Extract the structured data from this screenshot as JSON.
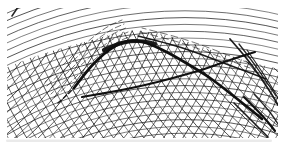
{
  "figure": {
    "canvas": {
      "width": 284,
      "height": 150
    },
    "colors": {
      "background": "#ffffff",
      "ink": "#101010",
      "smear": "#b9b9b9"
    },
    "content_clip": {
      "x": 7,
      "y": 8,
      "width": 271,
      "height": 130
    },
    "mesh_clip_boundary": [
      [
        0,
        70
      ],
      [
        30,
        58
      ],
      [
        62,
        48
      ],
      [
        92,
        40
      ],
      [
        116,
        33
      ],
      [
        136,
        30
      ],
      [
        162,
        34
      ],
      [
        186,
        41
      ],
      [
        208,
        49
      ],
      [
        236,
        58
      ],
      [
        266,
        66
      ],
      [
        284,
        70
      ],
      [
        284,
        150
      ],
      [
        0,
        150
      ]
    ],
    "arc_families": [
      {
        "name": "upper-concentric-arcs",
        "cx": 185,
        "cy": 432,
        "r_min": 292,
        "r_max": 466,
        "step": 6.8,
        "width": 0.75,
        "clipped": false
      },
      {
        "name": "steep-rising-arcs",
        "cx": -210,
        "cy": -120,
        "r_min": 246,
        "r_max": 566,
        "step": 8,
        "width": 0.8,
        "clipped": true
      },
      {
        "name": "steep-falling-arcs",
        "cx": 500,
        "cy": -150,
        "r_min": 266,
        "r_max": 586,
        "step": 8,
        "width": 0.8,
        "clipped": true
      }
    ],
    "feather_bands": [
      {
        "name": "arch-left-feather",
        "base": [
          [
            56,
            102
          ],
          [
            72,
            87
          ],
          [
            88,
            71
          ],
          [
            104,
            57
          ],
          [
            119,
            46
          ],
          [
            133,
            40
          ]
        ],
        "offsets": [
          [
            -2,
            -4
          ],
          [
            -5,
            -8
          ],
          [
            -7,
            -12
          ],
          [
            -9,
            -16
          ],
          [
            -11,
            -20
          ]
        ],
        "dash": "6 3",
        "width": 0.7,
        "opacity": 0.85
      },
      {
        "name": "arch-right-feather",
        "base": [
          [
            138,
            36
          ],
          [
            158,
            41
          ],
          [
            180,
            47
          ],
          [
            203,
            55
          ],
          [
            226,
            64
          ],
          [
            248,
            72
          ]
        ],
        "offsets": [
          [
            2,
            -4
          ],
          [
            4,
            -8
          ]
        ],
        "dash": "7 4",
        "width": 0.7,
        "opacity": 0.85
      }
    ],
    "envelope_curves": [
      {
        "name": "mesh-boundary-band",
        "width": 1.6,
        "opacity": 0.95,
        "dash": "",
        "points": [
          [
            138,
            36
          ],
          [
            158,
            41
          ],
          [
            180,
            47
          ],
          [
            203,
            55
          ],
          [
            226,
            64
          ],
          [
            248,
            72
          ],
          [
            266,
            79
          ]
        ]
      },
      {
        "name": "main-arch",
        "width": 2.7,
        "opacity": 1,
        "dash": "",
        "points": [
          [
            74,
            88
          ],
          [
            86,
            72
          ],
          [
            98,
            59
          ],
          [
            110,
            49
          ],
          [
            122,
            42
          ],
          [
            134,
            40
          ],
          [
            147,
            43
          ],
          [
            161,
            49
          ],
          [
            176,
            57
          ],
          [
            191,
            66
          ],
          [
            206,
            75
          ],
          [
            221,
            86
          ],
          [
            236,
            98
          ],
          [
            250,
            109
          ],
          [
            262,
            119
          ]
        ]
      },
      {
        "name": "arch-tail",
        "width": 1.5,
        "opacity": 0.9,
        "dash": "4 3",
        "points": [
          [
            58,
            103
          ],
          [
            66,
            96
          ],
          [
            74,
            88
          ]
        ]
      },
      {
        "name": "peak-thick-blob",
        "width": 4.2,
        "opacity": 0.95,
        "dash": "",
        "points": [
          [
            104,
            50
          ],
          [
            117,
            44
          ],
          [
            130,
            41
          ],
          [
            143,
            41
          ],
          [
            155,
            44
          ]
        ]
      },
      {
        "name": "inner-branch",
        "width": 2.1,
        "opacity": 1,
        "dash": "",
        "points": [
          [
            82,
            97
          ],
          [
            106,
            93
          ],
          [
            132,
            88
          ],
          [
            158,
            82
          ],
          [
            184,
            75
          ],
          [
            205,
            69
          ],
          [
            224,
            62
          ],
          [
            242,
            56
          ],
          [
            255,
            52
          ]
        ]
      },
      {
        "name": "steep-band-1",
        "width": 1.7,
        "opacity": 0.95,
        "dash": "",
        "points": [
          [
            230,
            39
          ],
          [
            245,
            56
          ],
          [
            259,
            75
          ],
          [
            271,
            93
          ],
          [
            278,
            105
          ]
        ]
      },
      {
        "name": "steep-band-2",
        "width": 1.3,
        "opacity": 0.9,
        "dash": "",
        "points": [
          [
            239,
            44
          ],
          [
            253,
            62
          ],
          [
            266,
            81
          ],
          [
            276,
            96
          ]
        ]
      },
      {
        "name": "steep-band-3",
        "width": 1.1,
        "opacity": 0.9,
        "dash": "",
        "points": [
          [
            247,
            50
          ],
          [
            261,
            70
          ],
          [
            273,
            89
          ],
          [
            280,
            102
          ]
        ]
      },
      {
        "name": "corner-accumulation-1",
        "width": 2.2,
        "opacity": 1,
        "dash": "",
        "points": [
          [
            244,
            97
          ],
          [
            257,
            110
          ],
          [
            268,
            122
          ],
          [
            275,
            131
          ]
        ]
      },
      {
        "name": "corner-accumulation-2",
        "width": 1.6,
        "opacity": 0.95,
        "dash": "",
        "points": [
          [
            234,
            103
          ],
          [
            248,
            117
          ],
          [
            261,
            130
          ],
          [
            268,
            137
          ]
        ]
      },
      {
        "name": "corner-accumulation-3",
        "width": 1.3,
        "opacity": 0.9,
        "dash": "",
        "points": [
          [
            254,
            94
          ],
          [
            266,
            107
          ],
          [
            275,
            119
          ],
          [
            281,
            129
          ]
        ]
      },
      {
        "name": "top-left-tick",
        "width": 1.6,
        "opacity": 0.9,
        "dash": "",
        "points": [
          [
            12,
            16
          ],
          [
            20,
            4
          ]
        ]
      }
    ],
    "bottom_smear": {
      "x": 6,
      "y": 139.5,
      "width": 266,
      "height": 2.4,
      "opacity": 0.3
    }
  }
}
